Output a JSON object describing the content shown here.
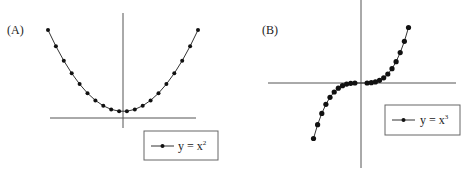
{
  "panels": [
    {
      "label": "(A)",
      "legend": {
        "text": "y = x",
        "exponent": "2"
      }
    },
    {
      "label": "(B)",
      "legend": {
        "text": "y = x",
        "exponent": "3"
      }
    }
  ],
  "colors": {
    "axis": "#555555",
    "curve": "#333333",
    "marker": "#111111",
    "legend_border": "#666666"
  },
  "chart_data": [
    {
      "type": "line",
      "title": "(A)",
      "xlabel": "",
      "ylabel": "",
      "legend": [
        "y = x^2"
      ],
      "legend_position": "bottom-right",
      "grid": false,
      "axis_ticks": false,
      "series": [
        {
          "name": "y = x^2",
          "x": [
            -9.5,
            -8.5,
            -7.5,
            -6.5,
            -5.5,
            -4.5,
            -3.5,
            -2.5,
            -1.5,
            -0.5,
            0.5,
            1.5,
            2.5,
            3.5,
            4.5,
            5.5,
            6.5,
            7.5,
            8.5,
            9.5
          ],
          "values": [
            90.25,
            72.25,
            56.25,
            42.25,
            30.25,
            20.25,
            12.25,
            6.25,
            2.25,
            0.25,
            0.25,
            2.25,
            6.25,
            12.25,
            20.25,
            30.25,
            42.25,
            56.25,
            72.25,
            90.25
          ]
        }
      ]
    },
    {
      "type": "line",
      "title": "(B)",
      "xlabel": "",
      "ylabel": "",
      "legend": [
        "y = x^3"
      ],
      "legend_position": "lower-right",
      "grid": false,
      "axis_ticks": false,
      "series": [
        {
          "name": "y = x^3",
          "x": [
            -11,
            -10,
            -9,
            -8,
            -7,
            -6,
            -5,
            -4,
            -3,
            -2,
            -1,
            1,
            2,
            3,
            4,
            5,
            6,
            7,
            8,
            9,
            10,
            11
          ],
          "values": [
            -1331,
            -1000,
            -729,
            -512,
            -343,
            -216,
            -125,
            -64,
            -27,
            -8,
            -1,
            1,
            8,
            27,
            64,
            125,
            216,
            343,
            512,
            729,
            1000,
            1331
          ]
        }
      ]
    }
  ]
}
